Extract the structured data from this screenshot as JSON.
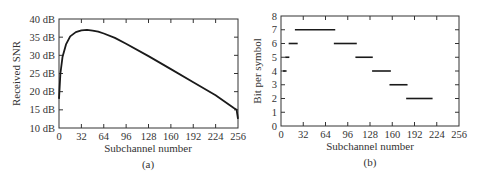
{
  "chart_data": [
    {
      "type": "line",
      "panel_label": "(a)",
      "title": "",
      "xlabel": "Subchannel number",
      "ylabel": "Received SNR",
      "xlim": [
        0,
        256
      ],
      "ylim": [
        10,
        40
      ],
      "x_ticks": [
        0,
        32,
        64,
        96,
        128,
        160,
        192,
        224,
        256
      ],
      "x_tick_labels": [
        "0",
        "32",
        "64",
        "96",
        "128",
        "160",
        "192",
        "224",
        "256"
      ],
      "y_ticks": [
        10,
        15,
        20,
        25,
        30,
        35,
        40
      ],
      "y_tick_labels": [
        "10 dB",
        "15 dB",
        "20 dB",
        "25 dB",
        "30 dB",
        "35 dB",
        "40 dB"
      ],
      "grid": false,
      "series": [
        {
          "name": "Received SNR",
          "x": [
            0,
            2,
            5,
            10,
            16,
            24,
            32,
            40,
            48,
            56,
            64,
            80,
            96,
            128,
            160,
            192,
            224,
            250,
            254,
            256
          ],
          "values": [
            18,
            25,
            29.5,
            33,
            35.2,
            36.4,
            36.9,
            37.0,
            36.8,
            36.5,
            36.0,
            34.8,
            33.2,
            29.8,
            26.2,
            22.6,
            19.0,
            15.5,
            15.0,
            12.5
          ]
        }
      ]
    },
    {
      "type": "line",
      "panel_label": "(b)",
      "title": "",
      "xlabel": "Subchannel number",
      "ylabel": "Bit per symbol",
      "xlim": [
        0,
        256
      ],
      "ylim": [
        0,
        8
      ],
      "x_ticks": [
        0,
        32,
        64,
        96,
        128,
        160,
        192,
        224,
        256
      ],
      "x_tick_labels": [
        "0",
        "32",
        "64",
        "96",
        "128",
        "160",
        "192",
        "224",
        "256"
      ],
      "y_ticks": [
        0,
        1,
        2,
        3,
        4,
        5,
        6,
        7,
        8
      ],
      "y_tick_labels": [
        "0",
        "1",
        "2",
        "3",
        "4",
        "5",
        "6",
        "7",
        "8"
      ],
      "grid": false,
      "segments": [
        {
          "bits": 4,
          "x_start": 3,
          "x_end": 8
        },
        {
          "bits": 5,
          "x_start": 6,
          "x_end": 12
        },
        {
          "bits": 6,
          "x_start": 11,
          "x_end": 24
        },
        {
          "bits": 7,
          "x_start": 20,
          "x_end": 78
        },
        {
          "bits": 6,
          "x_start": 76,
          "x_end": 109
        },
        {
          "bits": 5,
          "x_start": 107,
          "x_end": 132
        },
        {
          "bits": 4,
          "x_start": 131,
          "x_end": 158
        },
        {
          "bits": 3,
          "x_start": 156,
          "x_end": 182
        },
        {
          "bits": 2,
          "x_start": 180,
          "x_end": 218
        }
      ]
    }
  ],
  "colors": {
    "line": "#1a1a1a",
    "axis": "#333333",
    "text": "#333333"
  }
}
